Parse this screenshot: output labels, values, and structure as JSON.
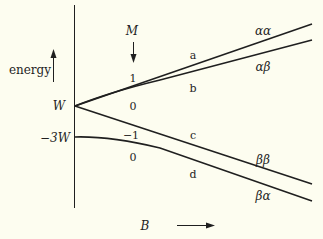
{
  "diagram": {
    "type": "energy-level-diagram",
    "axes": {
      "y_label": "energy",
      "x_label": "B"
    },
    "y_ticks": {
      "upper": "W",
      "lower": "−3W"
    },
    "m_header": "M",
    "m_values": [
      "1",
      "0",
      "−1",
      "0"
    ],
    "level_letters": [
      "a",
      "b",
      "c",
      "d"
    ],
    "state_labels": [
      "αα",
      "αβ",
      "ββ",
      "βα"
    ],
    "colors": {
      "background": "#fdfdf0",
      "ink": "#1f1f1f"
    }
  }
}
